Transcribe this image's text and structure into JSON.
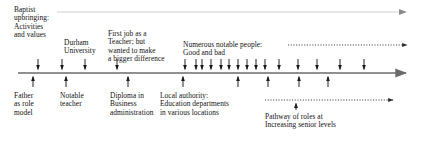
{
  "diagram": {
    "type": "annotated-timeline",
    "colors": {
      "axis": "#6b6b6b",
      "marker": "#1a1a1a",
      "text": "#111111",
      "faint_line": "#cfcfcf",
      "dotted": "#2b2b2b",
      "background": "#ffffff"
    },
    "main_axis": {
      "name": "main-timeline-axis",
      "x1": 18,
      "x2": 412,
      "y": 73,
      "arrow_end": "right"
    },
    "top_axis": {
      "name": "upper-faint-axis",
      "x1": 57,
      "x2": 412,
      "y": 12,
      "arrow_end": "right"
    },
    "dotted_spans": [
      {
        "name": "notable-people-span",
        "x1": 288,
        "x2": 412,
        "y": 45,
        "arrow_end": "right"
      },
      {
        "name": "pathway-of-roles-span",
        "x1": 265,
        "x2": 398,
        "y": 100,
        "arrow_end": "right"
      }
    ],
    "labels_above": [
      {
        "id": "baptist-upbringing",
        "lines": [
          "Baptist",
          "upbringing:",
          "Activities",
          "and values"
        ],
        "x": 14,
        "y": 6
      },
      {
        "id": "durham-university",
        "lines": [
          "Durham",
          "University"
        ],
        "x": 64,
        "y": 39
      },
      {
        "id": "first-job-teacher",
        "lines": [
          "First job as a",
          "Teacher; but",
          "wanted to make",
          "a bigger difference"
        ],
        "x": 108,
        "y": 30
      },
      {
        "id": "numerous-notable-people",
        "lines": [
          "Numerous notable people:",
          "Good and bad"
        ],
        "x": 183,
        "y": 41
      }
    ],
    "labels_below": [
      {
        "id": "father-as-role-model",
        "lines": [
          "Father",
          "as role",
          "model"
        ],
        "x": 14,
        "y": 92
      },
      {
        "id": "notable-teacher",
        "lines": [
          "Notable",
          "teacher"
        ],
        "x": 60,
        "y": 92
      },
      {
        "id": "diploma-business-administration",
        "lines": [
          "Diploma in",
          "Business",
          "administration"
        ],
        "x": 110,
        "y": 92
      },
      {
        "id": "local-authority-education",
        "lines": [
          "Local authority:",
          "Education departments",
          "in various locations"
        ],
        "x": 160,
        "y": 92
      },
      {
        "id": "pathway-of-roles",
        "lines": [
          "Pathway of roles at",
          "Increasing senior levels"
        ],
        "x": 265,
        "y": 113
      }
    ],
    "down_arrows": {
      "name": "influence-down-arrows",
      "description": "Arrows pointing down onto the main timeline, marking influences and events",
      "tip_y": 72,
      "tail_y": 59,
      "x_positions": [
        38,
        62,
        85,
        117,
        185,
        196,
        202,
        211,
        221,
        229,
        238,
        247,
        256,
        265,
        279,
        298,
        317,
        340,
        364
      ],
      "count": 19
    },
    "up_arrows": {
      "name": "role-up-arrows",
      "description": "Arrows pointing up onto the main timeline, marking roles and qualifications",
      "tip_y": 74,
      "tail_y": 87,
      "x_positions": [
        33,
        66,
        128,
        183,
        238,
        268,
        299,
        328
      ],
      "count": 8
    },
    "pathway_pointer": {
      "name": "pathway-pointer-arrow",
      "x": 296,
      "tip_y": 101,
      "tail_y": 110
    }
  }
}
